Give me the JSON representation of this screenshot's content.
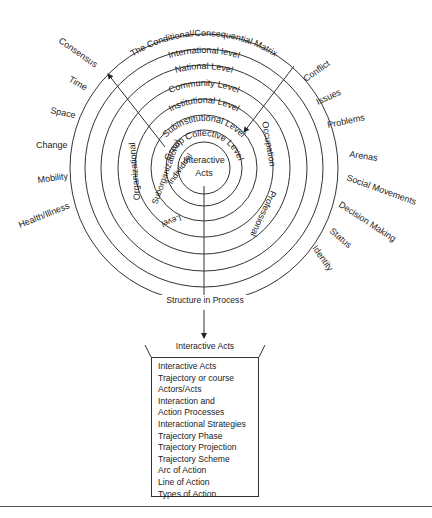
{
  "diagram": {
    "title": "The Conditional/Consequential Matrix",
    "rings": [
      "International level",
      "National Level",
      "Community Level",
      "Institutional Level",
      "Subinstitutional Level",
      "Group Collective Level"
    ],
    "center": [
      "Interactive",
      "Acts"
    ],
    "inner_left_labels": [
      "Organizational",
      "Suborganizational",
      "Individual",
      "Level"
    ],
    "inner_right_labels": [
      "Occupation",
      "Professional"
    ],
    "left_labels": [
      "Consensus",
      "Time",
      "Space",
      "Change",
      "Mobility",
      "Health/Illness"
    ],
    "right_labels": [
      "Conflict",
      "Issues",
      "Problems",
      "Arenas",
      "Social Movements",
      "Decision Making",
      "Status",
      "Identity"
    ],
    "structure_label": "Structure in Process",
    "box": {
      "heading": "Interactive Acts",
      "items": [
        "Interactive Acts",
        "Trajectory or course",
        "Actors/Acts",
        "Interaction and",
        "Action Processes",
        "Interactional Strategies",
        "Trajectory Phase",
        "Trajectory Projection",
        "Trajectory Scheme",
        "Arc of Action",
        "Line of Action",
        "Types of Action"
      ]
    }
  }
}
